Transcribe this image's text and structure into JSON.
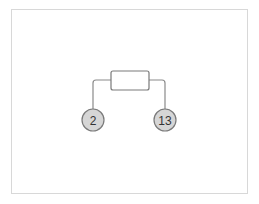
{
  "diagram": {
    "component": {
      "label": "",
      "shape": "rounded-rectangle"
    },
    "nodes": [
      {
        "id": "left",
        "label": "2"
      },
      {
        "id": "right",
        "label": "13"
      }
    ],
    "colors": {
      "line": "#8a8a8a",
      "node_fill": "#d6d6d6",
      "node_stroke": "#7a7a7a",
      "frame": "#d8d8d8"
    }
  }
}
